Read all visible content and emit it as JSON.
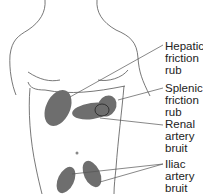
{
  "diagram": {
    "fill_color": "#6e6e6e",
    "line_color": "#555555",
    "labels": [
      {
        "id": "hepatic",
        "lines": [
          "Hepatic",
          "friction",
          "rub"
        ]
      },
      {
        "id": "splenic",
        "lines": [
          "Splenic",
          "friction",
          "rub"
        ]
      },
      {
        "id": "renal",
        "lines": [
          "Renal",
          "artery",
          "bruit"
        ]
      },
      {
        "id": "iliac",
        "lines": [
          "Iliac",
          "artery",
          "bruit"
        ]
      }
    ]
  }
}
